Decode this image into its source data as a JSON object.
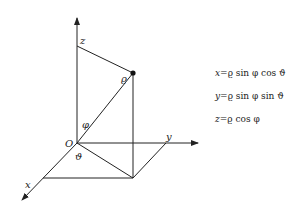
{
  "diagram": {
    "axes": {
      "z_label": "z",
      "y_label": "y",
      "x_label": "x",
      "origin_label": "O"
    },
    "angles": {
      "rho_label": "ϱ",
      "phi_label": "φ",
      "theta_label": "ϑ"
    },
    "equations": [
      {
        "lhs": "x",
        "rhs": "ϱ sin φ cos ϑ"
      },
      {
        "lhs": "y",
        "rhs": "ϱ sin φ sin ϑ"
      },
      {
        "lhs": "z",
        "rhs": "ϱ cos φ"
      }
    ],
    "colors": {
      "line": "#222222",
      "background": "#ffffff"
    }
  }
}
